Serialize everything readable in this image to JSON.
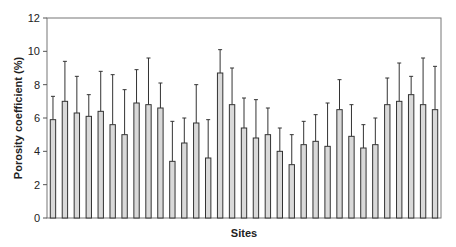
{
  "chart_data": {
    "type": "bar",
    "title": "",
    "xlabel": "Sites",
    "ylabel": "Porosity coefficient (%)",
    "ylim": [
      0,
      12
    ],
    "yticks": [
      0,
      2,
      4,
      6,
      8,
      10,
      12
    ],
    "grid": false,
    "legend": null,
    "bar_color": "#d9d9d9",
    "edge_color": "#333333",
    "categories": [
      "1",
      "2",
      "3",
      "4",
      "5",
      "6",
      "7",
      "8",
      "9",
      "10",
      "11",
      "12",
      "13",
      "14",
      "15",
      "16",
      "17",
      "18",
      "19",
      "20",
      "21",
      "22",
      "23",
      "24",
      "25",
      "26",
      "27",
      "28",
      "29",
      "30",
      "31",
      "32",
      "33"
    ],
    "series": [
      {
        "name": "Porosity coefficient",
        "values": [
          5.9,
          7.0,
          6.3,
          6.1,
          6.4,
          5.6,
          5.0,
          6.9,
          6.8,
          6.6,
          3.4,
          4.5,
          5.7,
          3.6,
          8.7,
          6.8,
          5.4,
          4.8,
          5.0,
          4.0,
          3.2,
          4.4,
          4.6,
          4.3,
          6.5,
          4.9,
          4.2,
          4.4,
          6.8,
          7.0,
          7.4,
          6.8,
          6.5
        ],
        "error_upper": [
          7.3,
          9.4,
          8.5,
          7.4,
          8.8,
          8.6,
          7.7,
          8.9,
          9.6,
          8.1,
          5.8,
          6.0,
          8.0,
          5.9,
          10.1,
          9.0,
          7.2,
          7.1,
          6.6,
          5.4,
          5.0,
          5.8,
          6.2,
          6.9,
          8.3,
          6.8,
          5.6,
          6.0,
          8.4,
          9.3,
          8.5,
          9.6,
          9.1
        ]
      }
    ]
  }
}
